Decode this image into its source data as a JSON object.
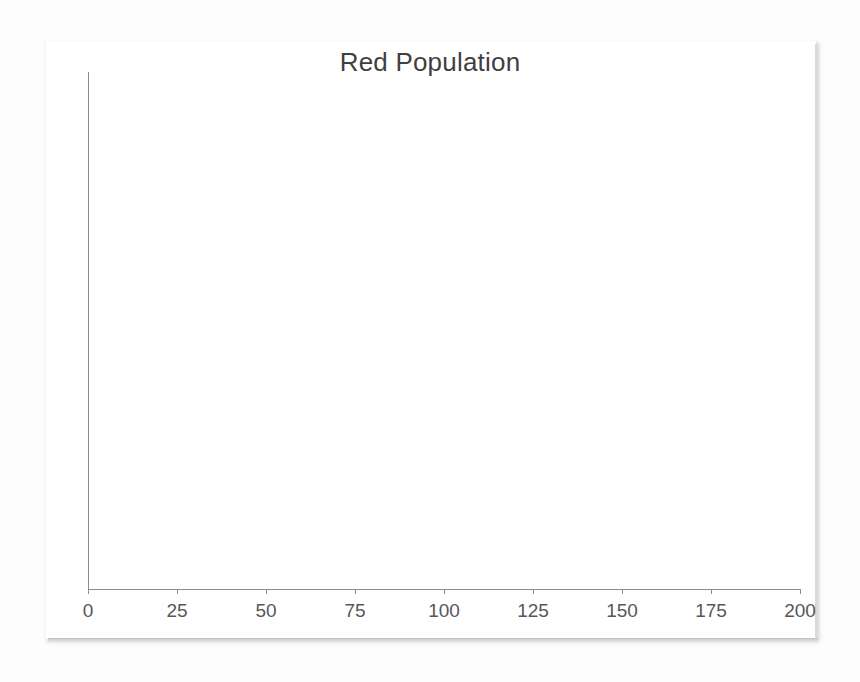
{
  "document": {
    "background_color": "#fdfdfd",
    "page_color": "#ffffff"
  },
  "chart": {
    "title": "Red Population",
    "title_color": "#3f3f3f",
    "axis_color": "#8d8d8d",
    "tick_label_color": "#575757"
  },
  "chart_data": {
    "type": "line",
    "title": "Red Population",
    "xlabel": "",
    "ylabel": "",
    "xlim": [
      0,
      200
    ],
    "ylim": [
      0,
      0
    ],
    "x_ticks": [
      0,
      25,
      50,
      75,
      100,
      125,
      150,
      175,
      200
    ],
    "x_tick_labels": [
      "0",
      "25",
      "50",
      "75",
      "100",
      "125",
      "150",
      "175",
      "200"
    ],
    "y_ticks": [],
    "y_tick_labels": [],
    "grid": false,
    "legend": false,
    "series": [
      {
        "name": "Red Population",
        "x": [],
        "values": []
      }
    ]
  }
}
